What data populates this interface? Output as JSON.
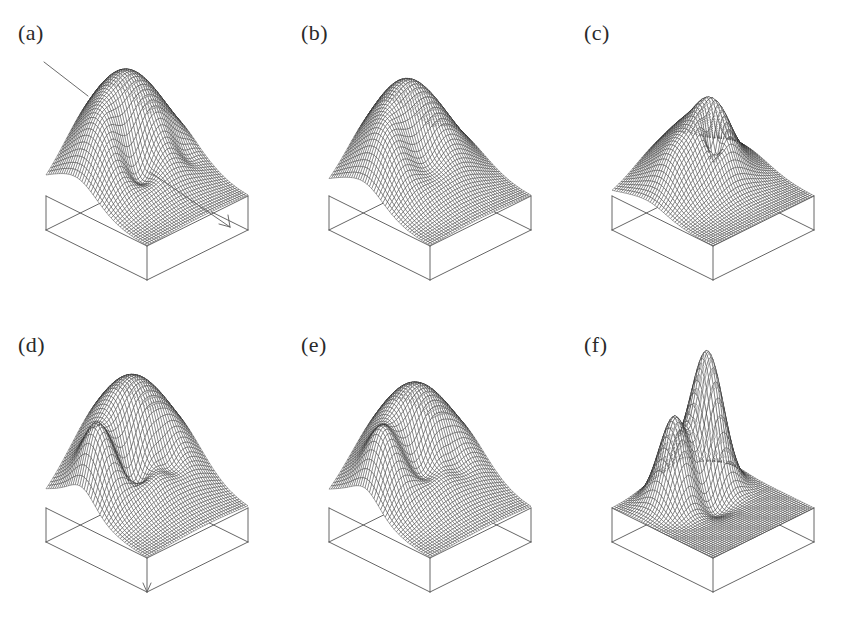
{
  "figure": {
    "title": "",
    "background_color": "#ffffff",
    "line_color": "#2b2b2b",
    "box_color": "#555555",
    "label_color": "#2a2a2a",
    "rows": 2,
    "columns": 3
  },
  "panels": [
    {
      "id": "a",
      "label": "(a)",
      "annotations": [
        {
          "type": "leader-line",
          "name": "surface-pointer-line"
        },
        {
          "type": "arrow",
          "name": "direction-arrow"
        }
      ]
    },
    {
      "id": "b",
      "label": "(b)",
      "annotations": []
    },
    {
      "id": "c",
      "label": "(c)",
      "annotations": []
    },
    {
      "id": "d",
      "label": "(d)",
      "annotations": [
        {
          "type": "arrow",
          "name": "axis-arrow"
        }
      ]
    },
    {
      "id": "e",
      "label": "(e)",
      "annotations": []
    },
    {
      "id": "f",
      "label": "(f)",
      "annotations": []
    }
  ],
  "chart_data": {
    "type": "surface",
    "title": "",
    "xlabel": "",
    "ylabel": "",
    "zlabel": "",
    "grid": false,
    "legend": null,
    "projection": {
      "kind": "axonometric",
      "azimuth_deg": 45,
      "elevation_deg": 32,
      "domain_x": [
        -1,
        1
      ],
      "domain_y": [
        -1,
        1
      ]
    },
    "mesh": {
      "nx": 46,
      "ny": 46
    },
    "panels": [
      {
        "id": "a",
        "label": "(a)",
        "zlim": [
          0,
          1
        ],
        "description": "Broad plateau rising to the rear with a saddle dip near the centre-left and a steep front slope.",
        "components": [
          {
            "kind": "gaussian",
            "amp": 0.92,
            "cx": 0.1,
            "cy": 0.55,
            "sx": 0.95,
            "sy": 0.8
          },
          {
            "kind": "gaussian",
            "amp": -0.34,
            "cx": -0.18,
            "cy": 0.02,
            "sx": 0.3,
            "sy": 0.26
          },
          {
            "kind": "gaussian",
            "amp": 0.2,
            "cx": -0.62,
            "cy": 0.3,
            "sx": 0.34,
            "sy": 0.4
          },
          {
            "kind": "gaussian",
            "amp": -0.1,
            "cx": 0.62,
            "cy": -0.1,
            "sx": 0.22,
            "sy": 0.2
          }
        ]
      },
      {
        "id": "b",
        "label": "(b)",
        "zlim": [
          0,
          1
        ],
        "description": "Smooth single dome centred to the rear with a shallow central trough.",
        "components": [
          {
            "kind": "gaussian",
            "amp": 0.88,
            "cx": 0.02,
            "cy": 0.48,
            "sx": 0.88,
            "sy": 0.78
          },
          {
            "kind": "gaussian",
            "amp": -0.26,
            "cx": -0.1,
            "cy": 0.02,
            "sx": 0.36,
            "sy": 0.3
          },
          {
            "kind": "gaussian",
            "amp": 0.18,
            "cx": -0.66,
            "cy": 0.22,
            "sx": 0.3,
            "sy": 0.38
          }
        ]
      },
      {
        "id": "c",
        "label": "(c)",
        "zlim": [
          0,
          1
        ],
        "description": "Lower overall relief with a sharp narrow central crater ringed by a raised rim.",
        "components": [
          {
            "kind": "gaussian",
            "amp": 0.56,
            "cx": 0.06,
            "cy": 0.42,
            "sx": 0.8,
            "sy": 0.7
          },
          {
            "kind": "gaussian",
            "amp": 0.34,
            "cx": 0.1,
            "cy": 0.08,
            "sx": 0.34,
            "sy": 0.3
          },
          {
            "kind": "gaussian",
            "amp": -0.42,
            "cx": 0.02,
            "cy": 0.02,
            "sx": 0.14,
            "sy": 0.13
          },
          {
            "kind": "gaussian",
            "amp": 0.16,
            "cx": -0.55,
            "cy": 0.2,
            "sx": 0.3,
            "sy": 0.34
          }
        ]
      },
      {
        "id": "d",
        "label": "(d)",
        "zlim": [
          0,
          1
        ],
        "description": "High back-right plateau falling to a deep front-left valley with a ridge crest on the left.",
        "components": [
          {
            "kind": "gaussian",
            "amp": 0.95,
            "cx": 0.22,
            "cy": 0.55,
            "sx": 1.0,
            "sy": 0.85
          },
          {
            "kind": "gaussian",
            "amp": 0.42,
            "cx": -0.72,
            "cy": 0.28,
            "sx": 0.26,
            "sy": 0.34
          },
          {
            "kind": "gaussian",
            "amp": -0.4,
            "cx": -0.14,
            "cy": 0.12,
            "sx": 0.26,
            "sy": 0.24
          },
          {
            "kind": "gaussian",
            "amp": -0.22,
            "cx": 0.3,
            "cy": -0.05,
            "sx": 0.26,
            "sy": 0.24
          }
        ]
      },
      {
        "id": "e",
        "label": "(e)",
        "zlim": [
          0,
          1
        ],
        "description": "Broad rear plateau with a pronounced left shoulder ridge and smooth front fall-off.",
        "components": [
          {
            "kind": "gaussian",
            "amp": 0.9,
            "cx": 0.18,
            "cy": 0.52,
            "sx": 1.0,
            "sy": 0.82
          },
          {
            "kind": "gaussian",
            "amp": 0.36,
            "cx": -0.7,
            "cy": 0.26,
            "sx": 0.28,
            "sy": 0.34
          },
          {
            "kind": "gaussian",
            "amp": -0.3,
            "cx": -0.1,
            "cy": 0.1,
            "sx": 0.28,
            "sy": 0.26
          },
          {
            "kind": "gaussian",
            "amp": -0.16,
            "cx": 0.36,
            "cy": -0.08,
            "sx": 0.28,
            "sy": 0.24
          }
        ]
      },
      {
        "id": "f",
        "label": "(f)",
        "zlim": [
          0,
          1
        ],
        "description": "Two separated peaks: a tall sharp peak to the right-rear and a lower rounded peak to the left.",
        "components": [
          {
            "kind": "gaussian",
            "amp": 1.0,
            "cx": 0.38,
            "cy": 0.46,
            "sx": 0.3,
            "sy": 0.32
          },
          {
            "kind": "gaussian",
            "amp": 0.62,
            "cx": -0.34,
            "cy": 0.4,
            "sx": 0.3,
            "sy": 0.3
          },
          {
            "kind": "gaussian",
            "amp": 0.3,
            "cx": 0.02,
            "cy": 0.62,
            "sx": 0.55,
            "sy": 0.3
          },
          {
            "kind": "gaussian",
            "amp": -0.12,
            "cx": 0.04,
            "cy": 0.08,
            "sx": 0.3,
            "sy": 0.26
          }
        ]
      }
    ]
  }
}
